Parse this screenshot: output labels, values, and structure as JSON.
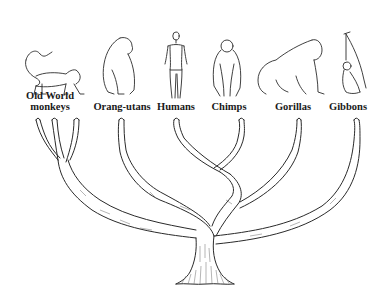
{
  "diagram": {
    "type": "phylogenetic-tree",
    "style": "pen-and-ink illustration",
    "background": "#ffffff",
    "ink_color": "#2a2a2a",
    "taxa": [
      {
        "id": "old-world-monkeys",
        "label_line1": "Old World",
        "label_line2": "monkeys",
        "x": 50,
        "branch_tips": [
          36,
          54,
          76
        ]
      },
      {
        "id": "orang-utans",
        "label": "Orang-utans",
        "x": 122,
        "branch_tips": [
          120
        ]
      },
      {
        "id": "humans",
        "label": "Humans",
        "x": 176,
        "branch_tips": [
          175
        ]
      },
      {
        "id": "chimps",
        "label": "Chimps",
        "x": 229,
        "branch_tips": [
          240
        ]
      },
      {
        "id": "gorillas",
        "label": "Gorillas",
        "x": 293,
        "branch_tips": [
          298
        ]
      },
      {
        "id": "gibbons",
        "label": "Gibbons",
        "x": 348,
        "branch_tips": [
          356
        ]
      }
    ],
    "relationships": [
      {
        "clade": [
          "humans",
          "chimps"
        ],
        "note": "humans and chimps share the most recent branch point"
      },
      {
        "clade": [
          "humans",
          "chimps",
          "gorillas"
        ]
      },
      {
        "clade": [
          "humans",
          "chimps",
          "gorillas",
          "orang-utans"
        ]
      },
      {
        "clade": [
          "humans",
          "chimps",
          "gorillas",
          "orang-utans",
          "gibbons"
        ]
      },
      {
        "clade": [
          "all apes",
          "old-world-monkeys"
        ],
        "note": "root trunk"
      }
    ]
  }
}
